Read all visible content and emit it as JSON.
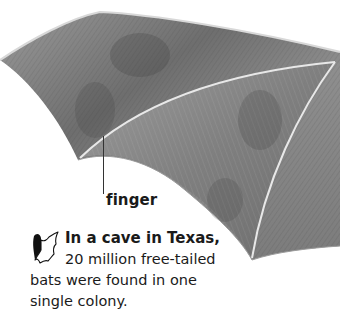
{
  "illustration": {
    "subject": "bat wing pencil drawing",
    "label": "finger"
  },
  "fact_box": {
    "icon": "bat-icon",
    "lead": "In a cave in Texas,",
    "line2": "20 million free-tailed",
    "line3": "bats were found in one",
    "line4": "single colony."
  },
  "colors": {
    "background": "#ffffff",
    "wing_dark": "#4a4a4a",
    "wing_mid": "#8a8a8a",
    "wing_light": "#b8b8b8",
    "bone": "#e6e6e6",
    "text": "#1a1a1a"
  }
}
